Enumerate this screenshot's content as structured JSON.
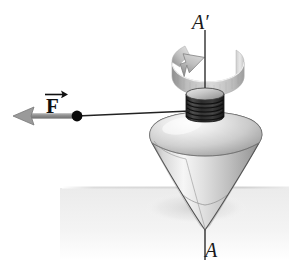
{
  "figure": {
    "background_color": "#ffffff",
    "width": 289,
    "height": 278
  },
  "labels": {
    "axis_top": "A′",
    "axis_bottom": "A",
    "force": "F"
  },
  "colors": {
    "outline": "#3c3c3c",
    "axis_line": "#1e1e1e",
    "string": "#242424",
    "dot": "#0a0a0a",
    "arrow_gray": "#9a9a9a",
    "arrow_gray_dark": "#6f6f6f",
    "ribbon_light": "#e2e2e2",
    "ribbon_mid": "#b4b4b4",
    "ribbon_dark": "#8c8c8c",
    "body_light": "#f2f2f2",
    "body_mid": "#c9c9c9",
    "body_dark": "#8f8f8f",
    "spool_dark": "#2a2a2a",
    "ground": "#f0f0f0",
    "ground_line": "#d6d6d6",
    "label_text": "#1a1a1a"
  },
  "geometry": {
    "axis_x": 205,
    "axis_top_y": 30,
    "axis_bottom_y": 258,
    "cone_tip_y": 230,
    "ground_line_y": 188,
    "force_arrow_tip_x": 14,
    "force_arrow_y": 116,
    "string_dot_x": 77,
    "string_dot_y": 116,
    "spool_center_x": 205,
    "spool_top_y": 94,
    "spool_bottom_y": 117,
    "ribbon_center_y": 65
  },
  "elements": [
    {
      "name": "rotation-ribbon-arrow",
      "description": "curved ribbon band with arrowhead indicating spin direction about axis"
    },
    {
      "name": "spin-axis",
      "description": "dashed vertical axis from A-prime to A"
    },
    {
      "name": "top-body",
      "description": "shaded spinning top: bulbous upper surface tapering to a point"
    },
    {
      "name": "string-spool",
      "description": "dark grooved cylinder with wound string at top of the top"
    },
    {
      "name": "force-vector",
      "description": "gray leftward arrow representing applied force F"
    },
    {
      "name": "string-line",
      "description": "thin line from force dot to the spool"
    },
    {
      "name": "ground-plane",
      "description": "light gray horizontal surface plane"
    }
  ]
}
